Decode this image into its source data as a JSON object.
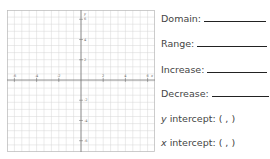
{
  "graph": {
    "x_ticks": [
      "-8",
      "-6",
      "-4",
      "-2",
      "2",
      "4",
      "6",
      "8"
    ],
    "y_ticks": [
      "8",
      "6",
      "4",
      "2",
      "-2",
      "-4",
      "-6",
      "-8"
    ],
    "x_axis_label": "x",
    "y_axis_label": "y",
    "grid_color": "#cfcfcf",
    "axis_color": "#555555"
  },
  "fields": {
    "domain": "Domain:",
    "range": "Range:",
    "increase": "Increase:",
    "decrease": "Decrease:",
    "y_intercept_var": "y",
    "y_intercept": "intercept: (  ,  )",
    "x_intercept_var": "x",
    "x_intercept": "intercept: (  ,  )"
  }
}
